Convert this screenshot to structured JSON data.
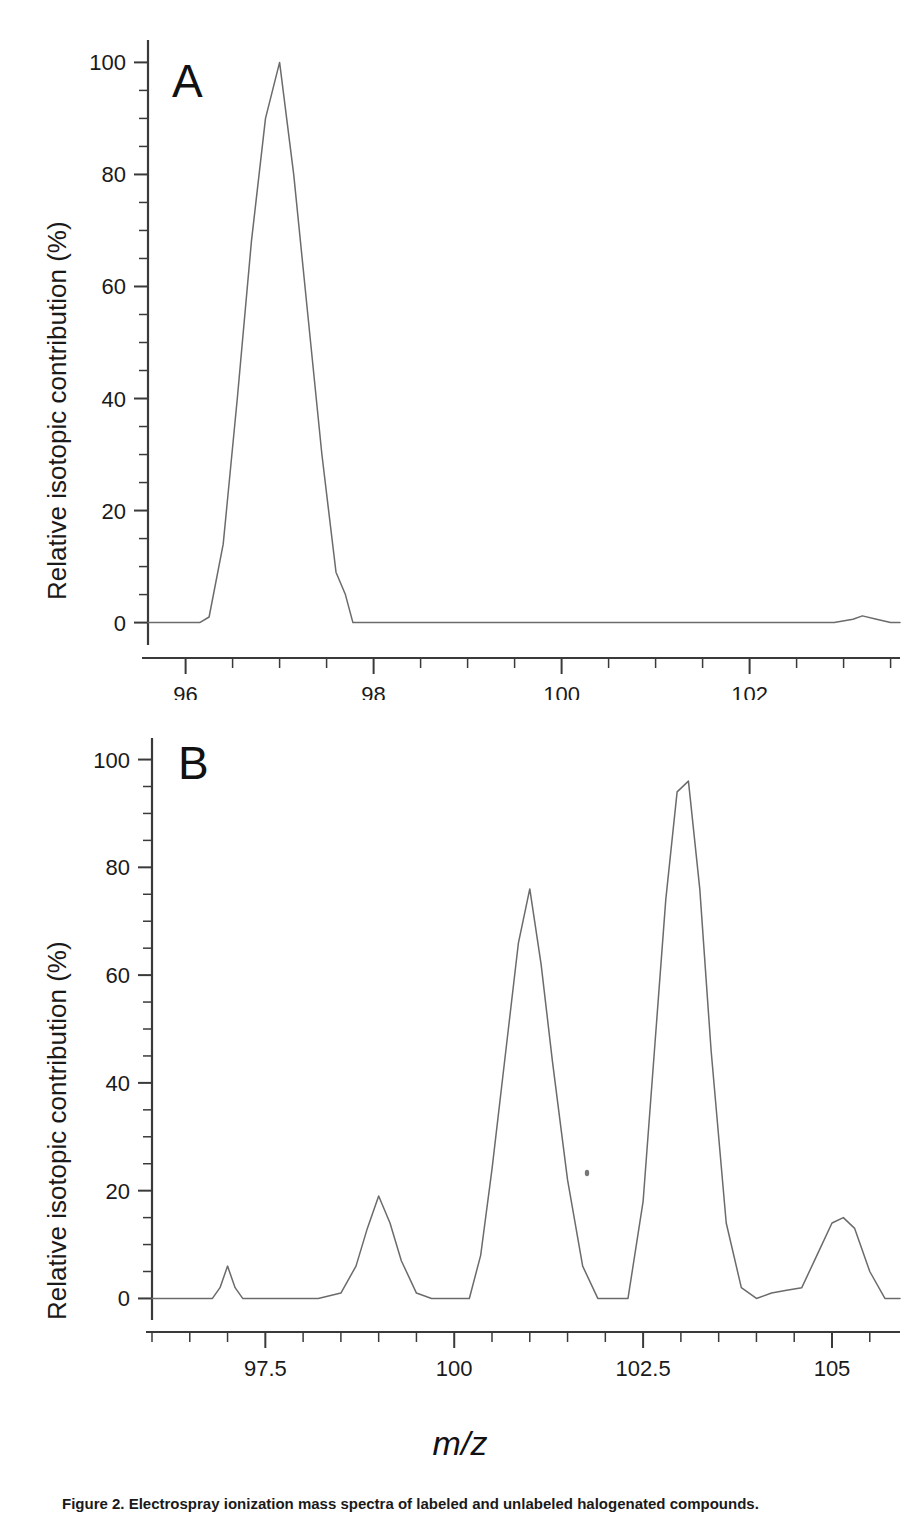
{
  "figure": {
    "xlabel": "m/z",
    "ylabel": "Relative isotopic contribution (%)",
    "caption": "Figure 2. Electrospray ionization mass spectra of labeled and unlabeled halogenated compounds."
  },
  "panel_a": {
    "letter": "A",
    "ylabel": "Relative isotopic contribution (%)",
    "y_ticks": [
      "0",
      "20",
      "40",
      "60",
      "80",
      "100"
    ],
    "x_ticks": [
      "96",
      "98",
      "100",
      "102"
    ]
  },
  "panel_b": {
    "letter": "B",
    "ylabel": "Relative isotopic contribution (%)",
    "y_ticks": [
      "0",
      "20",
      "40",
      "60",
      "80",
      "100"
    ],
    "x_ticks": [
      "97.5",
      "100",
      "102.5",
      "105"
    ]
  },
  "chart_data": [
    {
      "type": "line",
      "panel": "A",
      "title": "",
      "xlabel": "m/z",
      "ylabel": "Relative isotopic contribution (%)",
      "xlim": [
        95.6,
        103.6
      ],
      "ylim": [
        -4,
        104
      ],
      "grid": false,
      "legend": "none",
      "xtick_values": [
        96,
        98,
        100,
        102
      ],
      "xtick_labels": [
        "96",
        "98",
        "100",
        "102"
      ],
      "xminor_step": 0.5,
      "ytick_values": [
        0,
        20,
        40,
        60,
        80,
        100
      ],
      "ytick_labels": [
        "0",
        "20",
        "40",
        "60",
        "80",
        "100"
      ],
      "yminor_step": 5,
      "x": [
        95.6,
        96.0,
        96.15,
        96.25,
        96.4,
        96.55,
        96.7,
        96.85,
        97.0,
        97.15,
        97.3,
        97.45,
        97.6,
        97.7,
        97.78,
        97.9,
        98.5,
        99.5,
        100.5,
        101.5,
        102.4,
        102.9,
        103.1,
        103.2,
        103.35,
        103.5,
        103.6
      ],
      "y": [
        0,
        0,
        0,
        1,
        14,
        40,
        68,
        90,
        100,
        80,
        55,
        30,
        9,
        5,
        0,
        0,
        0,
        0,
        0,
        0,
        0,
        0,
        0.6,
        1.2,
        0.6,
        0,
        0
      ],
      "peaks": [
        {
          "mz": 97.0,
          "intensity": 100
        },
        {
          "mz": 103.2,
          "intensity": 1
        }
      ]
    },
    {
      "type": "line",
      "panel": "B",
      "title": "",
      "xlabel": "m/z",
      "ylabel": "Relative isotopic contribution (%)",
      "xlim": [
        96.0,
        105.9
      ],
      "ylim": [
        -4,
        104
      ],
      "grid": false,
      "legend": "none",
      "xtick_values": [
        97.5,
        100,
        102.5,
        105
      ],
      "xtick_labels": [
        "97.5",
        "100",
        "102.5",
        "105"
      ],
      "xminor_step": 0.5,
      "ytick_values": [
        0,
        20,
        40,
        60,
        80,
        100
      ],
      "ytick_labels": [
        "0",
        "20",
        "40",
        "60",
        "80",
        "100"
      ],
      "yminor_step": 5,
      "x": [
        96.0,
        96.6,
        96.8,
        96.9,
        97.0,
        97.1,
        97.2,
        97.4,
        98.2,
        98.5,
        98.7,
        98.85,
        99.0,
        99.15,
        99.3,
        99.5,
        99.7,
        99.9,
        100.2,
        100.35,
        100.5,
        100.7,
        100.85,
        101.0,
        101.15,
        101.3,
        101.5,
        101.7,
        101.9,
        102.1,
        102.3,
        102.5,
        102.65,
        102.8,
        102.95,
        103.1,
        103.25,
        103.4,
        103.6,
        103.8,
        104.0,
        104.2,
        104.4,
        104.6,
        104.8,
        105.0,
        105.15,
        105.3,
        105.5,
        105.7,
        105.9
      ],
      "y": [
        0,
        0,
        0,
        2,
        6,
        2,
        0,
        0,
        0,
        1,
        6,
        13,
        19,
        14,
        7,
        1,
        0,
        0,
        0,
        8,
        24,
        48,
        66,
        76,
        62,
        44,
        22,
        6,
        0,
        0,
        0,
        18,
        46,
        74,
        94,
        96,
        76,
        46,
        14,
        2,
        0,
        1,
        1.5,
        2,
        8,
        14,
        15,
        13,
        5,
        0,
        0
      ],
      "peaks": [
        {
          "mz": 97.0,
          "intensity": 6
        },
        {
          "mz": 99.0,
          "intensity": 19
        },
        {
          "mz": 101.0,
          "intensity": 76
        },
        {
          "mz": 103.0,
          "intensity": 96
        },
        {
          "mz": 105.1,
          "intensity": 15
        }
      ]
    }
  ]
}
